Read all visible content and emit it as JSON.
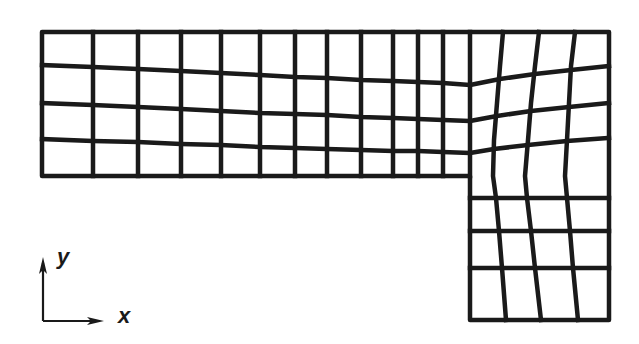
{
  "figure": {
    "stroke_color": "#1a1a1a",
    "background": "#ffffff",
    "line_width": 4.5
  },
  "axes": {
    "x_label": "x",
    "y_label": "y",
    "origin": [
      43,
      321
    ],
    "x_arrow_end": [
      104,
      321
    ],
    "y_arrow_end": [
      43,
      257
    ]
  },
  "mesh": {
    "outline": [
      [
        42,
        32
      ],
      [
        609,
        32
      ],
      [
        609,
        320
      ],
      [
        470,
        320
      ],
      [
        470,
        176
      ],
      [
        42,
        176
      ]
    ],
    "upper_verticals": [
      {
        "top": [
          93,
          32
        ],
        "bottom": [
          93,
          176
        ]
      },
      {
        "top": [
          138,
          32
        ],
        "bottom": [
          138,
          176
        ]
      },
      {
        "top": [
          181,
          32
        ],
        "bottom": [
          181,
          176
        ]
      },
      {
        "top": [
          221,
          32
        ],
        "bottom": [
          221,
          176
        ]
      },
      {
        "top": [
          260,
          32
        ],
        "bottom": [
          260,
          176
        ]
      },
      {
        "top": [
          295,
          32
        ],
        "bottom": [
          295,
          176
        ]
      },
      {
        "top": [
          327,
          32
        ],
        "bottom": [
          327,
          176
        ]
      },
      {
        "top": [
          361,
          32
        ],
        "bottom": [
          361,
          176
        ]
      },
      {
        "top": [
          393,
          32
        ],
        "bottom": [
          393,
          176
        ]
      },
      {
        "top": [
          418,
          32
        ],
        "bottom": [
          418,
          176
        ]
      },
      {
        "top": [
          443,
          32
        ],
        "bottom": [
          443,
          176
        ]
      },
      {
        "top": [
          470,
          32
        ],
        "bottom": [
          470,
          176
        ]
      }
    ],
    "right_columns": [
      [
        [
          503,
          32
        ],
        [
          500,
          66
        ],
        [
          497,
          103
        ],
        [
          494,
          140
        ],
        [
          493,
          176
        ],
        [
          496,
          198
        ],
        [
          499,
          231
        ],
        [
          502,
          268
        ],
        [
          506,
          320
        ]
      ],
      [
        [
          539,
          32
        ],
        [
          535,
          66
        ],
        [
          531,
          103
        ],
        [
          528,
          140
        ],
        [
          525,
          176
        ],
        [
          527,
          198
        ],
        [
          531,
          231
        ],
        [
          535,
          268
        ],
        [
          541,
          320
        ]
      ],
      [
        [
          575,
          32
        ],
        [
          571,
          66
        ],
        [
          569,
          103
        ],
        [
          567,
          140
        ],
        [
          565,
          176
        ],
        [
          567,
          198
        ],
        [
          570,
          231
        ],
        [
          573,
          268
        ],
        [
          578,
          320
        ]
      ]
    ],
    "upper_horizontals": [
      [
        [
          42,
          65
        ],
        [
          93,
          67
        ],
        [
          138,
          69
        ],
        [
          181,
          71
        ],
        [
          221,
          73
        ],
        [
          260,
          75
        ],
        [
          295,
          77
        ],
        [
          327,
          78
        ],
        [
          361,
          80
        ],
        [
          393,
          81
        ],
        [
          418,
          82
        ],
        [
          443,
          83
        ],
        [
          470,
          85
        ],
        [
          500,
          79
        ],
        [
          535,
          74
        ],
        [
          571,
          70
        ],
        [
          609,
          66
        ]
      ],
      [
        [
          42,
          103
        ],
        [
          93,
          105
        ],
        [
          138,
          107
        ],
        [
          181,
          109
        ],
        [
          221,
          111
        ],
        [
          260,
          113
        ],
        [
          295,
          114
        ],
        [
          327,
          115
        ],
        [
          361,
          117
        ],
        [
          393,
          118
        ],
        [
          418,
          119
        ],
        [
          443,
          120
        ],
        [
          470,
          121
        ],
        [
          497,
          116
        ],
        [
          531,
          111
        ],
        [
          569,
          107
        ],
        [
          609,
          103
        ]
      ],
      [
        [
          42,
          139
        ],
        [
          93,
          141
        ],
        [
          138,
          142
        ],
        [
          181,
          144
        ],
        [
          221,
          145
        ],
        [
          260,
          147
        ],
        [
          295,
          148
        ],
        [
          327,
          149
        ],
        [
          361,
          150
        ],
        [
          393,
          151
        ],
        [
          418,
          151
        ],
        [
          443,
          152
        ],
        [
          470,
          153
        ],
        [
          494,
          149
        ],
        [
          528,
          145
        ],
        [
          567,
          141
        ],
        [
          609,
          138
        ]
      ]
    ],
    "lower_horizontals": [
      [
        [
          470,
          198
        ],
        [
          609,
          198
        ]
      ],
      [
        [
          470,
          231
        ],
        [
          609,
          231
        ]
      ],
      [
        [
          470,
          268
        ],
        [
          609,
          268
        ]
      ]
    ]
  }
}
